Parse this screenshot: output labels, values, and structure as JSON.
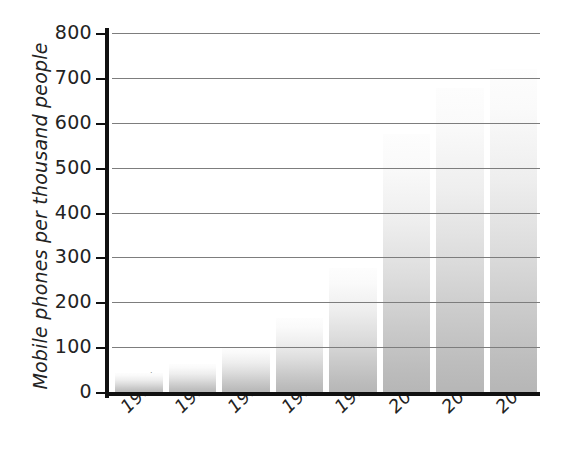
{
  "chart_data": {
    "type": "bar",
    "title": "",
    "subtitle": "",
    "xlabel": "",
    "ylabel": "Mobile phones per thousand people",
    "categories": [
      "1995",
      "1996",
      "1997",
      "1998",
      "1999",
      "2000",
      "2001",
      "2002"
    ],
    "values": [
      45,
      65,
      102,
      168,
      278,
      578,
      680,
      722
    ],
    "series": [
      {
        "name": "Mobile phones per thousand people",
        "values": [
          45,
          65,
          102,
          168,
          278,
          578,
          680,
          722
        ]
      }
    ],
    "ylim": [
      0,
      800
    ],
    "ytick_labels": [
      "800",
      "700",
      "600",
      "500",
      "400",
      "300",
      "200",
      "100",
      "0"
    ],
    "ytick_values": [
      800,
      700,
      600,
      500,
      400,
      300,
      200,
      100,
      0
    ],
    "grid": "horizontal",
    "legend": "none",
    "annotations": [],
    "colors": {
      "bar_top": "#fdfdfd",
      "bar_bottom": "#b6b6b6",
      "gridline": "#7d7d7d",
      "axis": "#111111",
      "text": "#232323",
      "background": "#ffffff"
    }
  }
}
